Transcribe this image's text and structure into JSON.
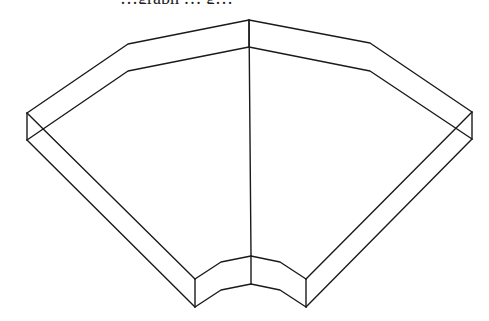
{
  "caption": {
    "text": "…graph … g…",
    "note": "clipped text line at top edge, only descenders visible"
  },
  "diagram": {
    "stroke_color": "#1a1a1a",
    "background": "#ffffff",
    "outer_top": [
      [
        27,
        113
      ],
      [
        128,
        44
      ],
      [
        249,
        20
      ],
      [
        370,
        43
      ],
      [
        472,
        112
      ]
    ],
    "outer_bottom": [
      [
        27,
        140
      ],
      [
        128,
        71
      ],
      [
        249,
        47
      ],
      [
        370,
        71
      ],
      [
        472,
        139
      ]
    ],
    "inner_top": [
      [
        195,
        279
      ],
      [
        221,
        262
      ],
      [
        251,
        256
      ],
      [
        280,
        262
      ],
      [
        306,
        279
      ]
    ],
    "inner_bottom": [
      [
        195,
        307
      ],
      [
        221,
        290
      ],
      [
        251,
        284
      ],
      [
        280,
        290
      ],
      [
        306,
        307
      ]
    ],
    "left_end": [
      [
        27,
        113
      ],
      [
        27,
        140
      ]
    ],
    "right_end": [
      [
        472,
        112
      ],
      [
        472,
        139
      ]
    ],
    "left_inner_end": [
      [
        195,
        279
      ],
      [
        195,
        307
      ]
    ],
    "right_inner_end": [
      [
        306,
        279
      ],
      [
        306,
        307
      ]
    ],
    "left_side_top": [
      [
        27,
        113
      ],
      [
        195,
        279
      ]
    ],
    "left_side_bottom": [
      [
        27,
        140
      ],
      [
        195,
        307
      ]
    ],
    "right_side_top": [
      [
        472,
        112
      ],
      [
        306,
        279
      ]
    ],
    "right_side_bottom": [
      [
        472,
        139
      ],
      [
        306,
        307
      ]
    ],
    "center_seam": [
      [
        249,
        20
      ],
      [
        251,
        256
      ]
    ],
    "center_seam_lower": [
      [
        251,
        256
      ],
      [
        251,
        284
      ]
    ],
    "center_seam_back": [
      [
        249,
        20
      ],
      [
        249,
        47
      ]
    ]
  }
}
